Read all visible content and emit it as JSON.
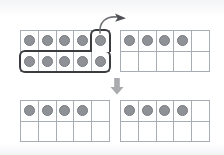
{
  "diagram": {
    "background_color": "#ffffff",
    "counter_color": "#8e9196",
    "grid_line_color": "#a8acb3",
    "highlight_outline_color": "#3a3c40",
    "arrow_color": "#9b9da1",
    "frames": [
      {
        "name": "top-left-ten-frame",
        "position": "top-left",
        "rows": 2,
        "columns": 5,
        "counter_count": 10,
        "top_row_filled": 5,
        "bottom_row_filled": 5,
        "highlighted_cells": 6,
        "highlight_label": "6"
      },
      {
        "name": "top-right-ten-frame",
        "position": "top-right",
        "rows": 2,
        "columns": 5,
        "counter_count": 4,
        "top_row_filled": 4,
        "bottom_row_filled": 0,
        "highlighted_cells": 0,
        "highlight_label": ""
      },
      {
        "name": "bottom-left-ten-frame",
        "position": "bottom-left",
        "rows": 2,
        "columns": 5,
        "counter_count": 4,
        "top_row_filled": 4,
        "bottom_row_filled": 0,
        "highlighted_cells": 0,
        "highlight_label": ""
      },
      {
        "name": "bottom-right-ten-frame",
        "position": "bottom-right",
        "rows": 2,
        "columns": 5,
        "counter_count": 4,
        "top_row_filled": 4,
        "bottom_row_filled": 0,
        "highlighted_cells": 0,
        "highlight_label": ""
      }
    ],
    "arrows": [
      {
        "name": "curved-move-arrow",
        "style": "curved",
        "direction": "up-right",
        "from": "top-left-ten-frame-highlighted-cell",
        "to": "top-right-ten-frame",
        "label": ""
      },
      {
        "name": "down-step-arrow",
        "style": "block",
        "direction": "down",
        "from": "top-row-of-frames",
        "to": "bottom-row-of-frames",
        "label": ""
      }
    ]
  }
}
